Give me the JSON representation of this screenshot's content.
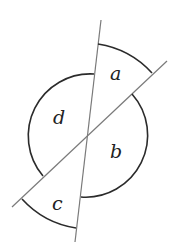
{
  "diagram": {
    "angles": [
      {
        "id": "a",
        "label": "a"
      },
      {
        "id": "b",
        "label": "b"
      },
      {
        "id": "c",
        "label": "c"
      },
      {
        "id": "d",
        "label": "d"
      }
    ],
    "colors": {
      "line": "#7a7a7a",
      "arc": "#2b2b2b",
      "label": "#222222"
    }
  }
}
